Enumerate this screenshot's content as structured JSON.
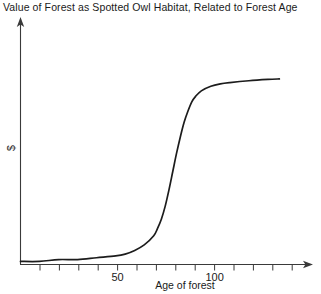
{
  "chart_data": {
    "type": "line",
    "title": "Value of Forest as Spotted Owl Habitat, Related to Forest Age",
    "xlabel": "Age of forest",
    "ylabel": "$",
    "xlim": [
      0,
      150
    ],
    "ylim": [
      0,
      1.08
    ],
    "grid": false,
    "legend": null,
    "curve_shape": "logistic sigmoid",
    "tick_labels_x": [
      "50",
      "100"
    ],
    "tick_values_x": [
      50,
      100
    ],
    "tick_interval_x": 10,
    "tick_values_all_x": [
      10,
      20,
      30,
      40,
      50,
      60,
      70,
      80,
      90,
      100,
      110,
      120,
      130,
      140
    ],
    "tick_labels_y": [],
    "axis_style": "arrow-terminated open axes",
    "series": [
      {
        "name": "Habitat value",
        "x": [
          0,
          10,
          20,
          30,
          40,
          50,
          55,
          60,
          65,
          70,
          72,
          74,
          76,
          78,
          80,
          82,
          84,
          86,
          88,
          90,
          92,
          95,
          100,
          105,
          110,
          120,
          130,
          136
        ],
        "values": [
          0.0,
          0.0,
          0.01,
          0.01,
          0.02,
          0.03,
          0.04,
          0.06,
          0.09,
          0.14,
          0.18,
          0.23,
          0.3,
          0.39,
          0.49,
          0.59,
          0.68,
          0.76,
          0.82,
          0.87,
          0.9,
          0.93,
          0.955,
          0.968,
          0.975,
          0.985,
          0.992,
          0.995
        ]
      }
    ]
  },
  "figure": {
    "title": "Value of Forest as Spotted Owl Habitat, Related to Forest Age",
    "xlabel": "Age of forest",
    "ylabel": "$",
    "tick_50": "50",
    "tick_100": "100"
  },
  "colors": {
    "curve": "#1c1c1c",
    "axis": "#3a3a3a",
    "text": "#1a1a1a",
    "background": "#ffffff"
  }
}
